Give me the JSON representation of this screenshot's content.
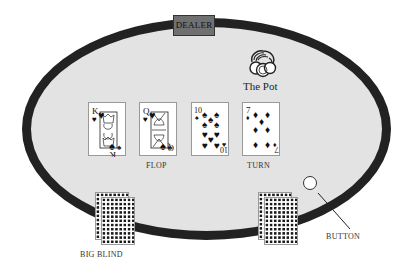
{
  "table": {
    "felt_color": "#e3e3e3",
    "rail_color": "#222222"
  },
  "dealer": {
    "label": "DEALER",
    "color": "#707070"
  },
  "pot": {
    "label": "The Pot",
    "icon": "chip-stack-icon"
  },
  "community_cards": [
    {
      "rank": "K",
      "suit": "hearts",
      "suit_glyph": "♥",
      "type": "face"
    },
    {
      "rank": "Q",
      "suit": "hearts",
      "suit_glyph": "♥",
      "type": "face"
    },
    {
      "rank": "10",
      "suit": "spades",
      "suit_glyph": "♠",
      "type": "pip"
    },
    {
      "rank": "7",
      "suit": "diamonds",
      "suit_glyph": "♦",
      "type": "pip"
    }
  ],
  "labels": {
    "flop": "FLOP",
    "turn": "TURN",
    "big_blind": "BIG BLIND",
    "button": "BUTTON"
  },
  "players": [
    {
      "position": "big-blind",
      "cards": "face-down",
      "count": 2
    },
    {
      "position": "button",
      "cards": "face-down",
      "count": 2
    }
  ]
}
